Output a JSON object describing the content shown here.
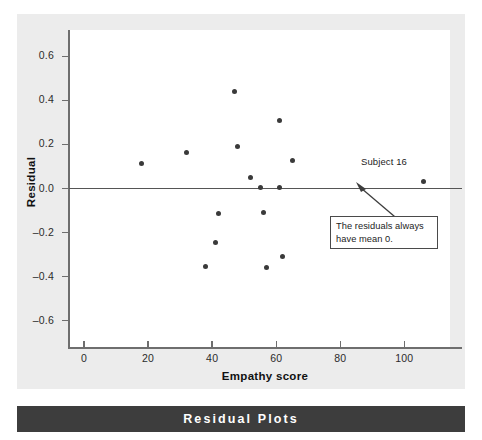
{
  "caption": {
    "text": "Residual Plots"
  },
  "chart_data": {
    "type": "scatter",
    "title": "",
    "xlabel": "Empathy score",
    "ylabel": "Residual",
    "xlim": [
      -5,
      118
    ],
    "ylim": [
      -0.72,
      0.72
    ],
    "xticks": [
      0,
      20,
      40,
      60,
      80,
      100
    ],
    "yticks": [
      0.6,
      0.4,
      0.2,
      0.0,
      -0.2,
      -0.4,
      -0.6
    ],
    "xtick_labels": [
      "0",
      "20",
      "40",
      "60",
      "80",
      "100"
    ],
    "ytick_labels": [
      "0.6",
      "0.4",
      "0.2",
      "0.0",
      "–0.2",
      "–0.4",
      "–0.6"
    ],
    "grid": false,
    "legend": null,
    "reference_line": {
      "y": 0.0,
      "style": "solid"
    },
    "points": [
      {
        "x": 18,
        "y": 0.115
      },
      {
        "x": 32,
        "y": 0.165
      },
      {
        "x": 38,
        "y": -0.355
      },
      {
        "x": 41,
        "y": -0.245
      },
      {
        "x": 42,
        "y": -0.115
      },
      {
        "x": 47,
        "y": 0.44
      },
      {
        "x": 48,
        "y": 0.19
      },
      {
        "x": 52,
        "y": 0.05
      },
      {
        "x": 55,
        "y": 0.005
      },
      {
        "x": 56,
        "y": -0.11
      },
      {
        "x": 57,
        "y": -0.36
      },
      {
        "x": 61,
        "y": 0.005
      },
      {
        "x": 61,
        "y": 0.31
      },
      {
        "x": 62,
        "y": -0.31
      },
      {
        "x": 65,
        "y": 0.125
      },
      {
        "x": 106,
        "y": 0.03
      }
    ],
    "annotations": [
      {
        "name": "subject-16-label",
        "text": "Subject 16"
      },
      {
        "name": "mean-zero-callout",
        "line1": "The residuals always",
        "line2": "have mean 0."
      }
    ]
  },
  "colors": {
    "matte": "#ececec",
    "plot_background": "#ffffff",
    "axis": "#6e6e6e",
    "point": "#3a3a3a",
    "caption_bar": "#3d3d3d",
    "caption_text": "#ffffff"
  }
}
